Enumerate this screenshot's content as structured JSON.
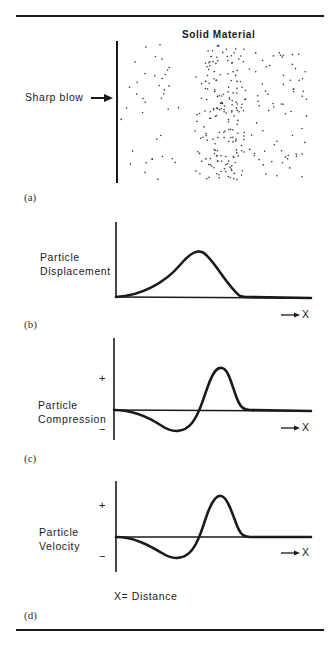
{
  "figure": {
    "panel_a": {
      "title": "Solid Material",
      "input_label": "Sharp blow",
      "caption": "(a)"
    },
    "panel_b": {
      "ylabel_line1": "Particle",
      "ylabel_line2": "Displacement",
      "x_arrow_label": "X",
      "caption": "(b)"
    },
    "panel_c": {
      "ylabel_line1": "Particle",
      "ylabel_line2": "Compression",
      "plus": "+",
      "minus": "−",
      "x_arrow_label": "X",
      "caption": "(c)"
    },
    "panel_d": {
      "ylabel_line1": "Particle",
      "ylabel_line2": "Velocity",
      "plus": "+",
      "minus": "−",
      "x_arrow_label": "X",
      "caption": "(d)"
    },
    "legend": "X= Distance",
    "colors": {
      "ink": "#1a1a1a",
      "background": "#ffffff"
    }
  }
}
